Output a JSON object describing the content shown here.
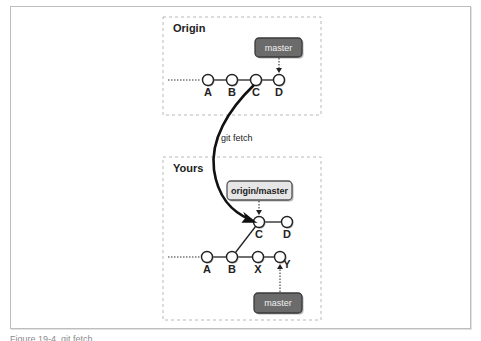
{
  "figure": {
    "caption": "Figure 19-4. git fetch",
    "regions": {
      "origin": {
        "title": "Origin",
        "box": {
          "x": 163,
          "y": 17,
          "w": 158,
          "h": 98
        },
        "label_pos": {
          "x": 173,
          "y": 32
        },
        "commits": [
          {
            "id": "A",
            "x": 208,
            "y": 80
          },
          {
            "id": "B",
            "x": 232,
            "y": 80
          },
          {
            "id": "C",
            "x": 256,
            "y": 80
          },
          {
            "id": "D",
            "x": 279,
            "y": 80
          }
        ],
        "edges": [
          [
            "A",
            "B"
          ],
          [
            "B",
            "C"
          ],
          [
            "C",
            "D"
          ]
        ],
        "history_stub": {
          "x1": 168,
          "x2": 201,
          "y": 80
        },
        "refs": [
          {
            "name": "master",
            "style": "dark",
            "x": 255,
            "y": 38,
            "w": 47,
            "h": 19,
            "points_to": "D"
          }
        ]
      },
      "yours": {
        "title": "Yours",
        "box": {
          "x": 163,
          "y": 157,
          "w": 158,
          "h": 163
        },
        "label_pos": {
          "x": 173,
          "y": 172
        },
        "commits": [
          {
            "id": "A",
            "x": 207,
            "y": 257
          },
          {
            "id": "B",
            "x": 232,
            "y": 257
          },
          {
            "id": "X",
            "x": 258,
            "y": 257
          },
          {
            "id": "Y",
            "x": 280,
            "y": 257
          },
          {
            "id": "C",
            "x": 259,
            "y": 222
          },
          {
            "id": "D",
            "x": 287,
            "y": 222
          }
        ],
        "edges": [
          [
            "A",
            "B"
          ],
          [
            "B",
            "X"
          ],
          [
            "X",
            "Y"
          ],
          [
            "B",
            "C"
          ],
          [
            "C",
            "D"
          ]
        ],
        "history_stub": {
          "x1": 168,
          "x2": 200,
          "y": 257
        },
        "refs": [
          {
            "name": "origin/master",
            "style": "light",
            "x": 227,
            "y": 181,
            "w": 65,
            "h": 19,
            "points_to": "C"
          },
          {
            "name": "master",
            "style": "dark",
            "x": 254,
            "y": 293,
            "w": 48,
            "h": 20,
            "points_to": "Y"
          }
        ]
      }
    },
    "operation": {
      "label": "git fetch",
      "label_pos": {
        "x": 221,
        "y": 141
      },
      "from": "origin.C",
      "to": "yours.C"
    },
    "colors": {
      "dark_ref_fill": "#6b6b6b",
      "dark_ref_stroke": "#3a3a3a",
      "light_ref_fill": "#e6e6e6",
      "light_ref_stroke": "#555555",
      "node_fill": "#ffffff",
      "node_stroke": "#222222",
      "dashed_box": "#b8b8b8"
    }
  }
}
